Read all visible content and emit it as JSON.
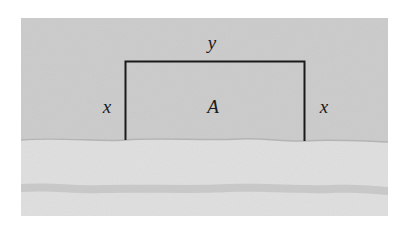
{
  "diagram": {
    "title": "",
    "labels": {
      "top_side": "y",
      "left_side": "x",
      "right_side": "x",
      "area": "A"
    },
    "colors": {
      "land": "#cfcfcf",
      "river": "#e2e2e2",
      "river_edge": "#bdbdbd",
      "river_band": "#c8c8c8",
      "fence": "#1a1a1a",
      "background": "#ffffff"
    }
  }
}
